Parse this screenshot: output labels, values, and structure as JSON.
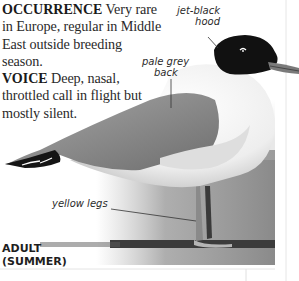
{
  "text": {
    "occurrence_heading": "OCCURRENCE",
    "occurrence_body": "Very rare in Europe, regular in Middle East outside breeding season.",
    "voice_heading": "VOICE",
    "voice_body": "Deep, nasal, throttled call in flight but mostly silent."
  },
  "labels": {
    "hood": [
      "jet-black",
      "hood"
    ],
    "back": [
      "pale grey",
      "back"
    ],
    "legs": "yellow legs"
  },
  "age_label": [
    "ADULT",
    "(SUMMER)"
  ],
  "colors": {
    "hood": "#111111",
    "mantle": "#8a8a8a",
    "body": "#f4f4f4",
    "background_grey": "#8c8c8c",
    "ground_band": "#3b3b3b"
  }
}
